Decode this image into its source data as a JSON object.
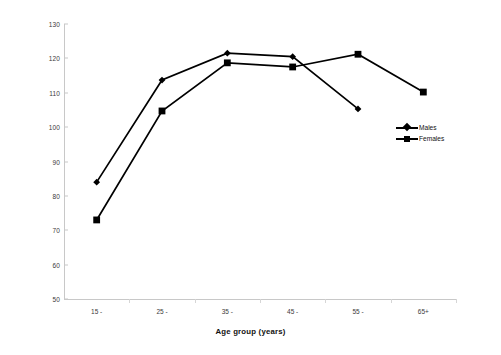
{
  "chart_data": {
    "type": "line",
    "title": "",
    "subtitle": "",
    "xlabel": "Age group (years)",
    "ylabel": "Lead concentration (ppm dry weight)",
    "categories": [
      "15 -",
      "25 -",
      "35 -",
      "45 -",
      "55 -",
      "65+"
    ],
    "ylim": [
      50,
      130
    ],
    "ytick_step": 10,
    "yticks": [
      130,
      120,
      110,
      100,
      90,
      80,
      70,
      60,
      50
    ],
    "grid": false,
    "legend_position": "center-right inside plot",
    "series": [
      {
        "name": "Males",
        "marker": "diamond",
        "color": "#000000",
        "values": [
          84.0,
          113.7,
          121.5,
          120.5,
          105.3,
          null
        ]
      },
      {
        "name": "Females",
        "marker": "square",
        "color": "#000000",
        "values": [
          73.0,
          104.7,
          118.7,
          117.5,
          121.2,
          110.2
        ]
      }
    ]
  },
  "legend": {
    "entries": [
      {
        "label": "Males",
        "marker": "diamond"
      },
      {
        "label": "Females",
        "marker": "square"
      }
    ]
  },
  "axes": {
    "y_title": "Lead concentration (ppm dry weight)",
    "x_title": "Age group (years)",
    "y_tick_labels": [
      "130",
      "120",
      "110",
      "100",
      "90",
      "80",
      "70",
      "60",
      "50"
    ],
    "x_tick_labels": [
      "15 -",
      "25 -",
      "35 -",
      "45 -",
      "55 -",
      "65+"
    ]
  },
  "style": {
    "series_color": "#000000",
    "axis_color": "#c8c8c8",
    "background": "#ffffff",
    "text_color": "#111111"
  }
}
